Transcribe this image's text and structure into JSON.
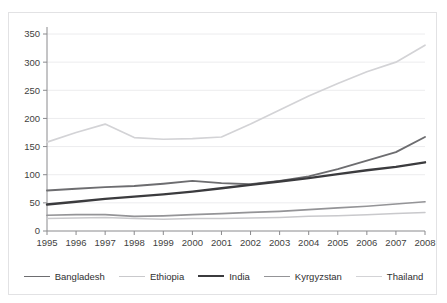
{
  "figure": {
    "cropped_title_sliver": "",
    "border_color": "#e2e2e4",
    "background": "#ffffff"
  },
  "chart_data": {
    "type": "line",
    "title": "",
    "xlabel": "",
    "ylabel": "",
    "x": [
      1995,
      1996,
      1997,
      1998,
      1999,
      2000,
      2001,
      2002,
      2003,
      2004,
      2005,
      2006,
      2007,
      2008
    ],
    "categories": [
      "1995",
      "1996",
      "1997",
      "1998",
      "1999",
      "2000",
      "2001",
      "2002",
      "2003",
      "2004",
      "2005",
      "2006",
      "2007",
      "2008"
    ],
    "xlim": [
      1995,
      2008
    ],
    "ylim": [
      0,
      350
    ],
    "yticks": [
      0,
      50,
      100,
      150,
      200,
      250,
      300,
      350
    ],
    "ytick_labels": [
      "0",
      "50",
      "100",
      "150",
      "200",
      "250",
      "300",
      "350"
    ],
    "grid": true,
    "grid_axis": "y",
    "legend_position": "bottom",
    "series": [
      {
        "name": "Bangladesh",
        "color": "#6d6d70",
        "width": 1.9,
        "values": [
          72,
          75,
          78,
          80,
          84,
          89,
          85,
          83,
          89,
          97,
          110,
          125,
          140,
          167
        ]
      },
      {
        "name": "Ethiopia",
        "color": "#c9c9cc",
        "width": 1.5,
        "values": [
          22,
          23,
          24,
          22,
          21,
          22,
          22,
          23,
          24,
          26,
          27,
          29,
          31,
          33
        ]
      },
      {
        "name": "India",
        "color": "#3b3b3e",
        "width": 2.4,
        "values": [
          47,
          52,
          57,
          61,
          65,
          70,
          76,
          82,
          88,
          94,
          101,
          108,
          114,
          122
        ]
      },
      {
        "name": "Kyrgyzstan",
        "color": "#949497",
        "width": 1.7,
        "values": [
          28,
          29,
          29,
          26,
          27,
          29,
          31,
          33,
          35,
          38,
          41,
          44,
          48,
          52
        ]
      },
      {
        "name": "Thailand",
        "color": "#d3d3d6",
        "width": 1.7,
        "values": [
          158,
          175,
          190,
          166,
          163,
          164,
          167,
          190,
          215,
          240,
          262,
          283,
          300,
          330
        ]
      }
    ]
  }
}
